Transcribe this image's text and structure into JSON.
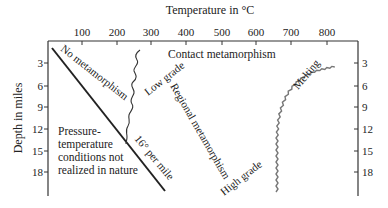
{
  "figure": {
    "x_axis": {
      "title": "Temperature in °C",
      "ticks": [
        "100",
        "200",
        "300",
        "400",
        "500",
        "600",
        "700",
        "800"
      ]
    },
    "y_axis": {
      "title": "Depth in miles",
      "ticks": [
        "3",
        "6",
        "9",
        "12",
        "15",
        "18"
      ],
      "right_ticks": [
        "3",
        "6",
        "9",
        "12",
        "15",
        "18"
      ]
    },
    "labels": {
      "no_metamorphism": "No metamorphism",
      "contact_metamorphism": "Contact metamorphism",
      "low_grade": "Low grade",
      "regional_metamorphism": "Regional metamorphism",
      "high_grade": "High grade",
      "melting": "Melting",
      "gradient": "16° per mile",
      "unrealized_line1": "Pressure-",
      "unrealized_line2": "temperature",
      "unrealized_line3": "conditions not",
      "unrealized_line4": "realized in nature"
    },
    "curves": {
      "geothermal_gradient": {
        "desc": "straight line, 16° per mile",
        "from": [
          15,
          1
        ],
        "to": [
          340,
          20
        ]
      },
      "metamorphism_onset": {
        "desc": "wavy line ~ 290°C near surface to ~ 225°C at 12 mi",
        "style": "wavy"
      },
      "melting_curve": {
        "desc": "wavy curve from ~ 650°C at 20 mi to ~ 840°C at surface",
        "style": "wavy"
      }
    },
    "colors": {
      "ink": "#222222",
      "melting": "#777777",
      "background": "#ffffff"
    }
  }
}
